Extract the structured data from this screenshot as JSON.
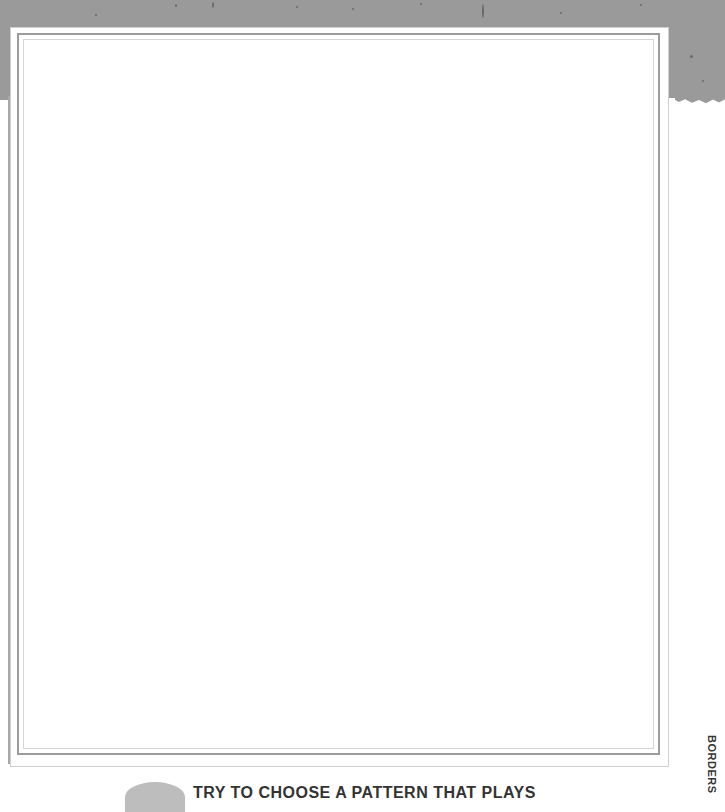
{
  "page": {
    "side_label": "BORDERS",
    "caption": "TRY TO CHOOSE A PATTERN THAT PLAYS"
  },
  "colors": {
    "header_band": "#9a9a9a",
    "frame_border": "#9c9c9c",
    "text": "#333333"
  }
}
